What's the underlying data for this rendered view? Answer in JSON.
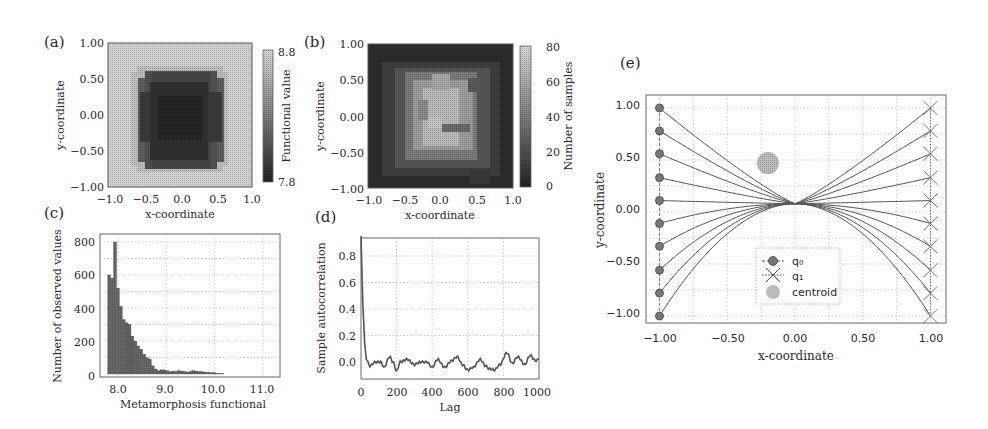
{
  "figure": {
    "panels": [
      "(a)",
      "(b)",
      "(c)",
      "(d)",
      "(e)"
    ]
  },
  "chart_data": [
    {
      "id": "a",
      "type": "heatmap",
      "panel_label": "(a)",
      "title": "",
      "xlabel": "x-coordinate",
      "ylabel": "y-coordinate",
      "xlim": [
        -1.0,
        1.0
      ],
      "ylim": [
        -1.0,
        1.0
      ],
      "xticks": [
        "−1.0",
        "−0.5",
        "0.0",
        "0.5",
        "1.0"
      ],
      "yticks": [
        "1.00",
        "0.50",
        "0.00",
        "−0.50",
        "−1.00"
      ],
      "colorbar": {
        "label": "Functional value",
        "min": 7.8,
        "max": 8.8,
        "ticks": [
          "8.8",
          "7.8"
        ],
        "cmap": "gray"
      },
      "description": "Dark (low ~7.8-8.0) roughly circular region centered near (-0.05, 0.0) with radius ~0.6; lighter (~8.8) outside"
    },
    {
      "id": "b",
      "type": "heatmap",
      "panel_label": "(b)",
      "xlabel": "x-coordinate",
      "ylabel": "y-coordinate",
      "xlim": [
        -1.0,
        1.0
      ],
      "ylim": [
        -1.0,
        1.0
      ],
      "xticks": [
        "−1.0",
        "−0.5",
        "0.0",
        "0.5",
        "1.0"
      ],
      "yticks": [
        "1.00",
        "0.50",
        "0.00",
        "−0.50",
        "−1.00"
      ],
      "colorbar": {
        "label": "Number of samples",
        "min": 0,
        "max": 80,
        "ticks": [
          "80",
          "60",
          "40",
          "20",
          "0"
        ],
        "cmap": "gray"
      },
      "description": "Bright (~60-75 samples) central region near origin, dark (~0-15) toward edges"
    },
    {
      "id": "c",
      "type": "bar",
      "panel_label": "(c)",
      "xlabel": "Metamorphosis functional",
      "ylabel": "Number of observed values",
      "xlim": [
        7.6,
        11.3
      ],
      "ylim": [
        0,
        850
      ],
      "xticks": [
        "8.0",
        "9.0",
        "10.0",
        "11.0"
      ],
      "yticks": [
        "800",
        "600",
        "400",
        "200",
        "0"
      ],
      "grid": true,
      "categories": [
        7.82,
        7.88,
        7.94,
        8.0,
        8.06,
        8.12,
        8.18,
        8.24,
        8.3,
        8.36,
        8.42,
        8.48,
        8.54,
        8.6,
        8.66,
        8.72,
        8.78,
        8.84,
        8.9,
        8.96,
        9.02,
        9.08,
        9.14,
        9.2,
        9.26,
        9.32,
        9.38,
        9.44,
        9.5,
        9.56,
        9.62,
        9.68,
        9.74,
        9.8,
        9.86,
        9.92,
        9.98,
        10.04,
        10.1,
        10.16
      ],
      "values": [
        600,
        580,
        800,
        520,
        410,
        330,
        310,
        300,
        230,
        200,
        170,
        150,
        120,
        100,
        90,
        50,
        30,
        20,
        25,
        25,
        20,
        15,
        18,
        15,
        20,
        18,
        15,
        12,
        15,
        20,
        18,
        16,
        14,
        12,
        10,
        8,
        8,
        5,
        4,
        2
      ]
    },
    {
      "id": "d",
      "type": "line",
      "panel_label": "(d)",
      "xlabel": "Lag",
      "ylabel": "Sample autocorrelation",
      "xlim": [
        0,
        1000
      ],
      "ylim": [
        -0.12,
        0.95
      ],
      "xticks": [
        "0",
        "200",
        "400",
        "600",
        "800",
        "1000"
      ],
      "yticks": [
        "0.8",
        "0.6",
        "0.4",
        "0.2",
        "0.0"
      ],
      "grid": true,
      "x": [
        0,
        10,
        20,
        30,
        50,
        80,
        110,
        130,
        160,
        180,
        200,
        220,
        260,
        300,
        330,
        370,
        400,
        430,
        470,
        510,
        540,
        570,
        600,
        630,
        670,
        700,
        720,
        750,
        780,
        820,
        850,
        880,
        920,
        950,
        980,
        1000
      ],
      "values": [
        0.95,
        0.45,
        0.15,
        0.02,
        -0.03,
        0.0,
        0.0,
        -0.04,
        0.04,
        0.0,
        -0.07,
        0.0,
        0.02,
        -0.02,
        0.0,
        0.0,
        -0.04,
        0.02,
        -0.04,
        0.01,
        0.04,
        -0.02,
        -0.06,
        -0.04,
        0.02,
        -0.03,
        -0.05,
        -0.06,
        -0.02,
        0.07,
        -0.01,
        0.04,
        -0.02,
        0.05,
        0.01,
        0.02
      ]
    },
    {
      "id": "e",
      "type": "line",
      "panel_label": "(e)",
      "xlabel": "x-coordinate",
      "ylabel": "y-coordinate",
      "xlim": [
        -1.1,
        1.1
      ],
      "ylim": [
        -1.1,
        1.1
      ],
      "xticks": [
        "−1.00",
        "−0.50",
        "0.00",
        "0.50",
        "1.00"
      ],
      "yticks": [
        "1.00",
        "0.50",
        "0.00",
        "−0.50",
        "−1.00"
      ],
      "grid": true,
      "legend": {
        "entries": [
          "q₀",
          "q₁",
          "centroid"
        ],
        "position": "lower center"
      },
      "q0": {
        "x": -1.0,
        "y": [
          1.0,
          0.78,
          0.56,
          0.33,
          0.11,
          -0.11,
          -0.33,
          -0.56,
          -0.78,
          -1.0
        ],
        "marker": "circle"
      },
      "q1": {
        "x": 1.0,
        "y": [
          1.0,
          0.78,
          0.56,
          0.33,
          0.11,
          -0.11,
          -0.33,
          -0.56,
          -0.78,
          -1.0
        ],
        "marker": "x"
      },
      "centroid": {
        "x": -0.2,
        "y": 0.47
      },
      "description": "10 geodesic curves from q0 points on x=-1 to mirrored q1 points on x=1, all converging near (0.0, 0.08)"
    }
  ]
}
